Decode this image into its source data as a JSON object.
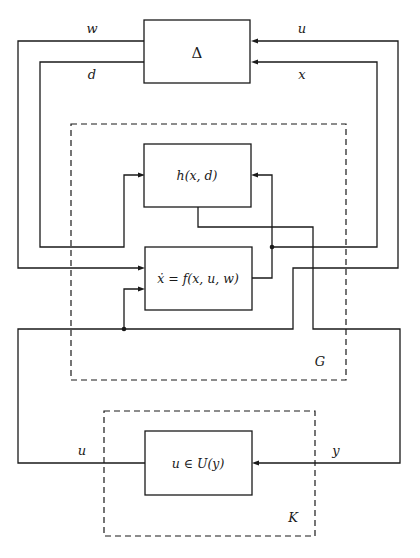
{
  "diagram": {
    "type": "block-diagram",
    "blocks": {
      "delta": {
        "label": "Δ"
      },
      "h": {
        "label": "h(x, d)"
      },
      "f": {
        "label": "ẋ = f(x, u, w)"
      },
      "controller": {
        "label": "u ∈ U(y)"
      }
    },
    "groups": {
      "plant": {
        "label": "G"
      },
      "controller_group": {
        "label": "K"
      }
    },
    "signals": {
      "w": "w",
      "d": "d",
      "u_top": "u",
      "x": "x",
      "u_bottom": "u",
      "y": "y"
    },
    "colors": {
      "line": "#1a1a1a",
      "background": "#ffffff"
    }
  }
}
